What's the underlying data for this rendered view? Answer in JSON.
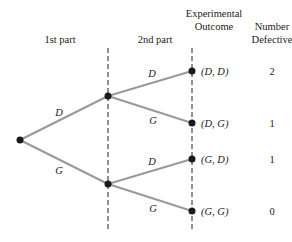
{
  "headers": {
    "first_part": "1st part",
    "second_part": "2nd part",
    "outcome_line1": "Experimental",
    "outcome_line2": "Outcome",
    "defective_line1": "Number",
    "defective_line2": "Defective"
  },
  "branches": {
    "root_upper": "D",
    "root_lower": "G",
    "upper_upper": "D",
    "upper_lower": "G",
    "lower_upper": "D",
    "lower_lower": "G"
  },
  "outcomes": [
    {
      "label": "(D, D)",
      "defective": "2"
    },
    {
      "label": "(D, G)",
      "defective": "1"
    },
    {
      "label": "(G, D)",
      "defective": "1"
    },
    {
      "label": "(G, G)",
      "defective": "0"
    }
  ],
  "colors": {
    "edge": "#9a9a9a",
    "node": "#1a1a1a",
    "text": "#222222"
  }
}
